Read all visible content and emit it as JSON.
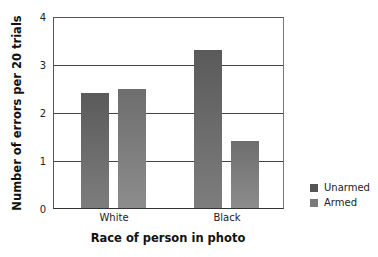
{
  "chart_data": {
    "type": "bar",
    "title": "",
    "xlabel": "Race of person in photo",
    "ylabel": "Number of errors per 20 trials",
    "categories": [
      "White",
      "Black"
    ],
    "series": [
      {
        "name": "Unarmed",
        "values": [
          2.4,
          3.3
        ],
        "color": "#5a5a5a"
      },
      {
        "name": "Armed",
        "values": [
          2.5,
          1.4
        ],
        "color": "#7a7a7a"
      }
    ],
    "ylim": [
      0,
      4
    ],
    "yticks": [
      "0",
      "1",
      "2",
      "3",
      "4"
    ],
    "grid": true,
    "legend_position": "right"
  }
}
